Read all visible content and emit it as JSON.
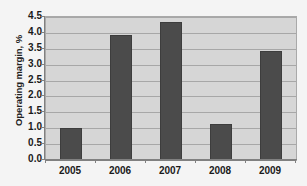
{
  "chart_data": {
    "type": "bar",
    "title": "",
    "categories": [
      "2005",
      "2006",
      "2007",
      "2008",
      "2009"
    ],
    "values": [
      1.0,
      3.93,
      4.35,
      1.13,
      3.43
    ],
    "series": [
      {
        "name": "Operating margin",
        "values": [
          1.0,
          3.93,
          4.35,
          1.13,
          3.43
        ]
      }
    ],
    "xlabel": "",
    "ylabel": "Operating margin, %",
    "ylim": [
      0.0,
      4.5
    ],
    "ytick_labels": [
      "0.0",
      "0.5",
      "1.0",
      "1.5",
      "2.0",
      "2.5",
      "3.0",
      "3.5",
      "4.0",
      "4.5"
    ],
    "ytick_values": [
      0.0,
      0.5,
      1.0,
      1.5,
      2.0,
      2.5,
      3.0,
      3.5,
      4.0,
      4.5
    ],
    "grid": true,
    "legend": false,
    "legend_position": "none",
    "bar_color": "#4b4b4b",
    "plot_background": "#d6d6d6",
    "figure_background": "#f4f4f4",
    "gridline_color": "#a7a7a7",
    "axis_color": "#808080"
  }
}
